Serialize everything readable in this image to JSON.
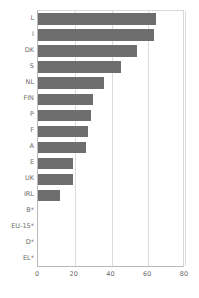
{
  "chart_data": {
    "type": "bar",
    "orientation": "horizontal",
    "title": "",
    "subtitle": "",
    "xlabel": "",
    "ylabel": "",
    "categories": [
      "L",
      "I",
      "DK",
      "S",
      "NL",
      "FIN",
      "P",
      "F",
      "A",
      "E",
      "UK",
      "IRL",
      "B*",
      "EU-15*",
      "D*",
      "EL*"
    ],
    "values": [
      64,
      63,
      54,
      45,
      36,
      30,
      29,
      27,
      26,
      19,
      19,
      12,
      0,
      0,
      0,
      0
    ],
    "series": [
      {
        "name": "",
        "values": [
          64,
          63,
          54,
          45,
          36,
          30,
          29,
          27,
          26,
          19,
          19,
          12,
          0,
          0,
          0,
          0
        ]
      }
    ],
    "xlim": [
      0,
      80
    ],
    "xticks": [
      0,
      20,
      40,
      60,
      80
    ],
    "xtick_labels": [
      "0",
      "20",
      "40",
      "60",
      "80"
    ],
    "grid": "vertical-only",
    "legend": "none",
    "bar_color": "#6e6e6e",
    "gridline_color": "#dcdcdc",
    "axis_color": "#b9b9b9",
    "text_color": "#6a6a6a",
    "annotations": []
  }
}
